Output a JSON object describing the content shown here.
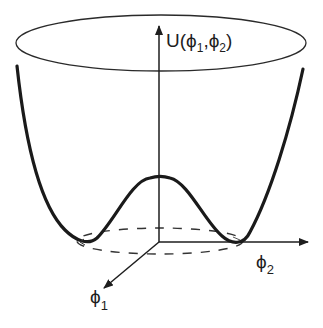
{
  "figure": {
    "type": "mexican-hat-potential",
    "labels": {
      "potential_func": "U(",
      "phi": "ϕ",
      "sub1": "1",
      "sub2": "2",
      "comma": ",",
      "close": ")"
    },
    "axes": {
      "vertical": "U(ϕ1,ϕ2)",
      "horizontal": "ϕ2",
      "depth": "ϕ1"
    },
    "colors": {
      "ink": "#1e1e1e",
      "background": "#ffffff"
    }
  }
}
